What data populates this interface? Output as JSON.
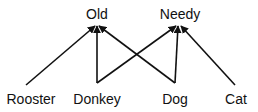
{
  "diagram": {
    "type": "directed-graph",
    "colors": {
      "edge": "#111111",
      "text": "#111111",
      "background": "#ffffff"
    },
    "nodes": [
      {
        "id": "old",
        "label": "Old",
        "x": 97,
        "y": 7
      },
      {
        "id": "needy",
        "label": "Needy",
        "x": 180,
        "y": 7
      },
      {
        "id": "rooster",
        "label": "Rooster",
        "x": 31,
        "y": 92
      },
      {
        "id": "donkey",
        "label": "Donkey",
        "x": 97,
        "y": 92
      },
      {
        "id": "dog",
        "label": "Dog",
        "x": 175,
        "y": 92
      },
      {
        "id": "cat",
        "label": "Cat",
        "x": 236,
        "y": 92
      }
    ],
    "edges": [
      {
        "from": "rooster",
        "to": "old",
        "x1": 26,
        "y1": 85,
        "x2": 95,
        "y2": 26
      },
      {
        "from": "donkey",
        "to": "old",
        "x1": 97,
        "y1": 83,
        "x2": 97,
        "y2": 26
      },
      {
        "from": "dog",
        "to": "old",
        "x1": 175,
        "y1": 83,
        "x2": 99,
        "y2": 26
      },
      {
        "from": "donkey",
        "to": "needy",
        "x1": 97,
        "y1": 83,
        "x2": 176,
        "y2": 26
      },
      {
        "from": "dog",
        "to": "needy",
        "x1": 175,
        "y1": 83,
        "x2": 178,
        "y2": 26
      },
      {
        "from": "cat",
        "to": "needy",
        "x1": 235,
        "y1": 85,
        "x2": 181,
        "y2": 26
      }
    ]
  }
}
